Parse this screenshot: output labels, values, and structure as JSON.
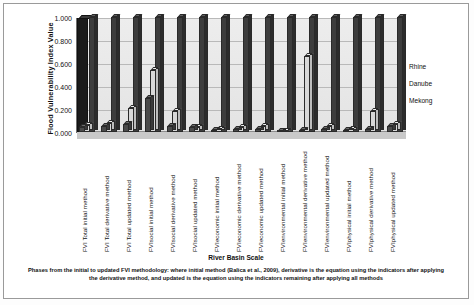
{
  "chart_data": {
    "type": "bar",
    "title": "",
    "xlabel": "River Basin Scale",
    "ylabel": "Flood Vulnerability Index Value",
    "ylim": [
      0.0,
      1.0
    ],
    "yticks": [
      "0.000",
      "0.200",
      "0.400",
      "0.600",
      "0.800",
      "1.000"
    ],
    "ytick_values": [
      0.0,
      0.2,
      0.4,
      0.6,
      0.8,
      1.0
    ],
    "grid": true,
    "legend_position": "right",
    "categories": [
      "FVI Total initial method",
      "FVI Total derivative method",
      "FVI Total updated method",
      "FVIsocial initial method",
      "FVIsocial derivative method",
      "FVIsocial updated method",
      "FVIeconomic initial method",
      "FVIeconomic derivative method",
      "FVIeconomic updated method",
      "FVIenvironmental initial method",
      "FVIenvironmental derivative method",
      "FVIenvironmental updated method",
      "FVIphysical initial method",
      "FVIphysical derivative method",
      "FVIphysical updated method"
    ],
    "series": [
      {
        "name": "Rhine",
        "color": "#4a4a4a",
        "values": [
          0.04,
          0.05,
          0.07,
          0.3,
          0.05,
          0.04,
          0.02,
          0.03,
          0.03,
          0.01,
          0.02,
          0.03,
          0.02,
          0.03,
          0.05
        ]
      },
      {
        "name": "Danube",
        "color": "#e5e5e5",
        "values": [
          0.06,
          0.08,
          0.21,
          0.54,
          0.18,
          0.04,
          0.03,
          0.04,
          0.05,
          0.01,
          0.66,
          0.05,
          0.03,
          0.18,
          0.07
        ]
      },
      {
        "name": "Mekong",
        "color": "#3d3d3d",
        "values": [
          1.0,
          1.0,
          1.0,
          1.0,
          1.0,
          1.0,
          1.0,
          1.0,
          1.0,
          1.0,
          1.0,
          1.0,
          1.0,
          1.0,
          1.0
        ]
      }
    ]
  },
  "legend": {
    "items": [
      {
        "label": "Rhine"
      },
      {
        "label": "Danube"
      },
      {
        "label": "Mekong"
      }
    ]
  },
  "axis": {
    "y_title": "Flood Vulnerability Index Value",
    "x_title": "River Basin Scale"
  },
  "caption": {
    "text": "Phases from the initial to updated  FVI methodology:  where initial method (Balica et al., 2009),  derivative  is the equation using the indicators after applying the derivative method, and updated is the equation using the indicators remaining after applying all methods"
  }
}
